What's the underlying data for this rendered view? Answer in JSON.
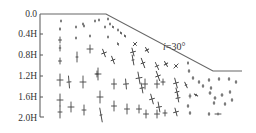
{
  "diagram": {
    "type": "slope stress field (principal stress crosses)",
    "y_axis": {
      "ticks": [
        {
          "label": "0.0",
          "y": 14
        },
        {
          "label": "0.4H",
          "y": 34
        },
        {
          "label": "0.8H",
          "y": 55
        },
        {
          "label": "1.2H",
          "y": 76
        },
        {
          "label": "1.6H",
          "y": 97
        },
        {
          "label": "2.0H",
          "y": 117
        }
      ]
    },
    "slope": {
      "label": "i=30°",
      "label_italic": "i",
      "label_rest": "=30°",
      "crest": [
        106,
        14
      ],
      "toe": [
        213,
        71
      ],
      "top_left": [
        40,
        14
      ],
      "bottom_right": [
        242,
        71
      ]
    },
    "colors": {
      "line": "#666666",
      "marker": "#444444",
      "text": "#333333"
    }
  }
}
